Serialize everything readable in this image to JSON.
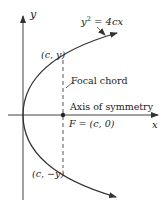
{
  "diagram": {
    "axes": {
      "x_label": "x",
      "y_label": "y"
    },
    "curve": {
      "equation_lhs": "y",
      "equation_exp": "2",
      "equation_rhs": " = 4cx"
    },
    "points": {
      "upper": "(c, y)",
      "lower": "(c, −y)",
      "focus": "F = (c, 0)"
    },
    "annotations": {
      "focal_chord": "Focal chord",
      "axis_of_symmetry": "Axis of symmetry"
    },
    "colors": {
      "stroke": "#333333",
      "text": "#222222",
      "background": "#ffffff"
    }
  }
}
